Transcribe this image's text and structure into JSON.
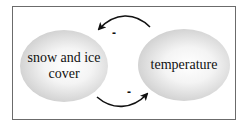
{
  "diagram": {
    "nodes": [
      {
        "id": "snow",
        "label": "snow and ice cover"
      },
      {
        "id": "temp",
        "label": "temperature"
      }
    ],
    "edges": [
      {
        "from": "temp",
        "to": "snow",
        "sign": "-"
      },
      {
        "from": "snow",
        "to": "temp",
        "sign": "-"
      }
    ],
    "colors": {
      "border": "#6b6b6b",
      "arrow": "#111111",
      "node_edge": "#9a9a9a"
    }
  }
}
